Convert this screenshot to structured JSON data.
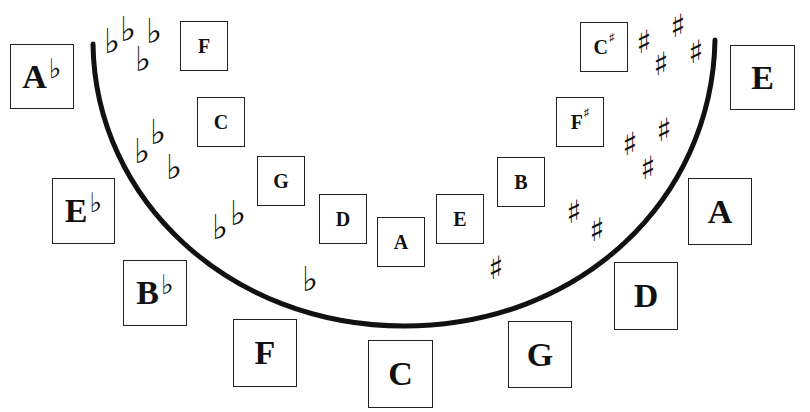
{
  "diagram": {
    "type": "circle-of-fifths-key-signatures",
    "stroke_color": "#111111",
    "background": "#ffffff"
  },
  "outer_keys": [
    {
      "note": "A",
      "accidental": "♭",
      "acc_type": "flat",
      "x": 10,
      "y": 44,
      "w": 64,
      "h": 65
    },
    {
      "note": "E",
      "accidental": "♭",
      "acc_type": "flat",
      "x": 52,
      "y": 178,
      "w": 63,
      "h": 66
    },
    {
      "note": "B",
      "accidental": "♭",
      "acc_type": "flat",
      "x": 123,
      "y": 260,
      "w": 64,
      "h": 66
    },
    {
      "note": "F",
      "accidental": "",
      "acc_type": "none",
      "x": 233,
      "y": 319,
      "w": 64,
      "h": 68
    },
    {
      "note": "C",
      "accidental": "",
      "acc_type": "none",
      "x": 368,
      "y": 340,
      "w": 65,
      "h": 68
    },
    {
      "note": "G",
      "accidental": "",
      "acc_type": "none",
      "x": 508,
      "y": 321,
      "w": 64,
      "h": 67
    },
    {
      "note": "D",
      "accidental": "",
      "acc_type": "none",
      "x": 614,
      "y": 262,
      "w": 64,
      "h": 68
    },
    {
      "note": "A",
      "accidental": "",
      "acc_type": "none",
      "x": 688,
      "y": 178,
      "w": 64,
      "h": 67
    },
    {
      "note": "E",
      "accidental": "",
      "acc_type": "none",
      "x": 730,
      "y": 45,
      "w": 65,
      "h": 65
    }
  ],
  "inner_keys": [
    {
      "note": "F",
      "accidental": "",
      "acc_type": "none",
      "x": 180,
      "y": 21,
      "w": 48,
      "h": 50
    },
    {
      "note": "C",
      "accidental": "",
      "acc_type": "none",
      "x": 197,
      "y": 97,
      "w": 48,
      "h": 50
    },
    {
      "note": "G",
      "accidental": "",
      "acc_type": "none",
      "x": 257,
      "y": 156,
      "w": 48,
      "h": 50
    },
    {
      "note": "D",
      "accidental": "",
      "acc_type": "none",
      "x": 319,
      "y": 194,
      "w": 48,
      "h": 50
    },
    {
      "note": "A",
      "accidental": "",
      "acc_type": "none",
      "x": 377,
      "y": 217,
      "w": 48,
      "h": 50
    },
    {
      "note": "E",
      "accidental": "",
      "acc_type": "none",
      "x": 436,
      "y": 194,
      "w": 48,
      "h": 50
    },
    {
      "note": "B",
      "accidental": "",
      "acc_type": "none",
      "x": 497,
      "y": 157,
      "w": 48,
      "h": 50
    },
    {
      "note": "F",
      "accidental": "♯",
      "acc_type": "sharp",
      "x": 556,
      "y": 97,
      "w": 48,
      "h": 50
    },
    {
      "note": "C",
      "accidental": "♯",
      "acc_type": "sharp",
      "x": 580,
      "y": 22,
      "w": 48,
      "h": 50
    }
  ],
  "signatures": [
    {
      "label": "4 flats",
      "glyphs": [
        {
          "g": "♭",
          "x": 104,
          "y": 24
        },
        {
          "g": "♭",
          "x": 120,
          "y": 12
        },
        {
          "g": "♭",
          "x": 135,
          "y": 42
        },
        {
          "g": "♭",
          "x": 146,
          "y": 14
        }
      ]
    },
    {
      "label": "3 flats",
      "glyphs": [
        {
          "g": "♭",
          "x": 134,
          "y": 134
        },
        {
          "g": "♭",
          "x": 150,
          "y": 115
        },
        {
          "g": "♭",
          "x": 166,
          "y": 150
        }
      ]
    },
    {
      "label": "2 flats",
      "glyphs": [
        {
          "g": "♭",
          "x": 212,
          "y": 210
        },
        {
          "g": "♭",
          "x": 230,
          "y": 196
        }
      ]
    },
    {
      "label": "1 flat",
      "glyphs": [
        {
          "g": "♭",
          "x": 302,
          "y": 262
        }
      ]
    },
    {
      "label": "1 sharp",
      "glyphs": [
        {
          "g": "♯",
          "x": 488,
          "y": 252
        }
      ]
    },
    {
      "label": "2 sharps",
      "glyphs": [
        {
          "g": "♯",
          "x": 566,
          "y": 196
        },
        {
          "g": "♯",
          "x": 589,
          "y": 214
        }
      ]
    },
    {
      "label": "3 sharps",
      "glyphs": [
        {
          "g": "♯",
          "x": 622,
          "y": 128
        },
        {
          "g": "♯",
          "x": 640,
          "y": 152
        },
        {
          "g": "♯",
          "x": 656,
          "y": 114
        }
      ]
    },
    {
      "label": "4 sharps",
      "glyphs": [
        {
          "g": "♯",
          "x": 636,
          "y": 26
        },
        {
          "g": "♯",
          "x": 653,
          "y": 48
        },
        {
          "g": "♯",
          "x": 670,
          "y": 10
        },
        {
          "g": "♯",
          "x": 688,
          "y": 36
        }
      ]
    }
  ],
  "arc": {
    "start_x": 93,
    "start_y": 44,
    "end_x": 715,
    "end_y": 40,
    "bottom_y": 326
  }
}
